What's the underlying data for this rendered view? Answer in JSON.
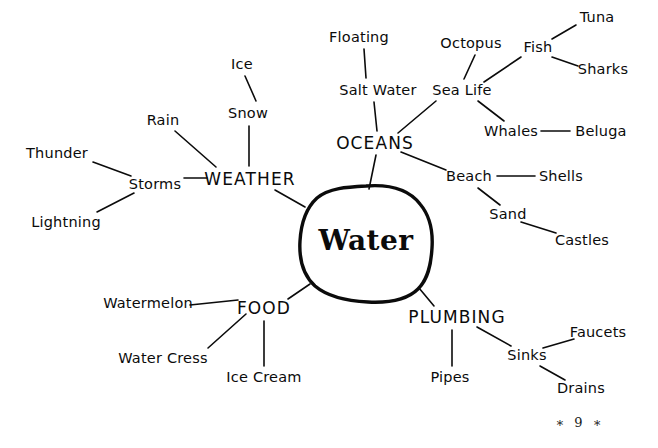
{
  "document": {
    "type": "mind-map",
    "title": "Water",
    "page_number": "9",
    "page_marker": "∗ 9 ∗",
    "background_color": "#ffffff",
    "ink_color": "#0b0b0b"
  },
  "center": {
    "label": "Water",
    "shape": "hand-drawn-blob",
    "x": 366,
    "y": 241
  },
  "branches": [
    {
      "id": "weather",
      "label": "WEATHER",
      "x": 250,
      "y": 179,
      "children": [
        "Rain",
        "Ice",
        "Snow",
        "Storms",
        "Thunder",
        "Lightning"
      ]
    },
    {
      "id": "oceans",
      "label": "OCEANS",
      "x": 375,
      "y": 143,
      "children": [
        "Floating",
        "Salt Water",
        "Sea Life",
        "Octopus",
        "Fish",
        "Tuna",
        "Sharks",
        "Whales",
        "Beluga",
        "Beach",
        "Shells",
        "Sand",
        "Castles"
      ]
    },
    {
      "id": "food",
      "label": "FOOD",
      "x": 264,
      "y": 308,
      "children": [
        "Watermelon",
        "Water Cress",
        "Ice Cream"
      ]
    },
    {
      "id": "plumbing",
      "label": "PLUMBING",
      "x": 457,
      "y": 317,
      "children": [
        "Pipes",
        "Sinks",
        "Faucets",
        "Drains"
      ]
    }
  ],
  "nodes": [
    {
      "id": "thunder",
      "label": "Thunder",
      "x": 57,
      "y": 153,
      "kind": "sub"
    },
    {
      "id": "lightning",
      "label": "Lightning",
      "x": 66,
      "y": 222,
      "kind": "sub"
    },
    {
      "id": "storms",
      "label": "Storms",
      "x": 155,
      "y": 184,
      "kind": "sub"
    },
    {
      "id": "rain",
      "label": "Rain",
      "x": 163,
      "y": 120,
      "kind": "sub"
    },
    {
      "id": "ice",
      "label": "Ice",
      "x": 242,
      "y": 64,
      "kind": "sub"
    },
    {
      "id": "snow",
      "label": "Snow",
      "x": 248,
      "y": 113,
      "kind": "sub"
    },
    {
      "id": "weather",
      "label": "WEATHER",
      "x": 250,
      "y": 179,
      "kind": "branch"
    },
    {
      "id": "floating",
      "label": "Floating",
      "x": 359,
      "y": 37,
      "kind": "sub"
    },
    {
      "id": "saltwater",
      "label": "Salt Water",
      "x": 378,
      "y": 90,
      "kind": "sub"
    },
    {
      "id": "oceans",
      "label": "OCEANS",
      "x": 375,
      "y": 143,
      "kind": "branch"
    },
    {
      "id": "sealife",
      "label": "Sea Life",
      "x": 462,
      "y": 90,
      "kind": "sub"
    },
    {
      "id": "octopus",
      "label": "Octopus",
      "x": 471,
      "y": 43,
      "kind": "sub"
    },
    {
      "id": "fish",
      "label": "Fish",
      "x": 538,
      "y": 47,
      "kind": "sub"
    },
    {
      "id": "tuna",
      "label": "Tuna",
      "x": 597,
      "y": 17,
      "kind": "sub"
    },
    {
      "id": "sharks",
      "label": "Sharks",
      "x": 603,
      "y": 69,
      "kind": "sub"
    },
    {
      "id": "whales",
      "label": "Whales",
      "x": 511,
      "y": 131,
      "kind": "sub"
    },
    {
      "id": "beluga",
      "label": "Beluga",
      "x": 601,
      "y": 131,
      "kind": "sub"
    },
    {
      "id": "beach",
      "label": "Beach",
      "x": 469,
      "y": 176,
      "kind": "sub"
    },
    {
      "id": "shells",
      "label": "Shells",
      "x": 561,
      "y": 176,
      "kind": "sub"
    },
    {
      "id": "sand",
      "label": "Sand",
      "x": 508,
      "y": 214,
      "kind": "sub"
    },
    {
      "id": "castles",
      "label": "Castles",
      "x": 582,
      "y": 240,
      "kind": "sub"
    },
    {
      "id": "watermelon",
      "label": "Watermelon",
      "x": 148,
      "y": 303,
      "kind": "sub"
    },
    {
      "id": "food",
      "label": "FOOD",
      "x": 264,
      "y": 308,
      "kind": "branch"
    },
    {
      "id": "watercress",
      "label": "Water Cress",
      "x": 163,
      "y": 358,
      "kind": "sub"
    },
    {
      "id": "icecream",
      "label": "Ice Cream",
      "x": 264,
      "y": 377,
      "kind": "sub"
    },
    {
      "id": "plumbing",
      "label": "PLUMBING",
      "x": 457,
      "y": 317,
      "kind": "branch"
    },
    {
      "id": "pipes",
      "label": "Pipes",
      "x": 450,
      "y": 377,
      "kind": "sub"
    },
    {
      "id": "sinks",
      "label": "Sinks",
      "x": 527,
      "y": 355,
      "kind": "sub"
    },
    {
      "id": "faucets",
      "label": "Faucets",
      "x": 598,
      "y": 332,
      "kind": "sub"
    },
    {
      "id": "drains",
      "label": "Drains",
      "x": 581,
      "y": 388,
      "kind": "sub"
    }
  ],
  "edges": [
    {
      "from": "thunder",
      "to": "storms",
      "x1": 93,
      "y1": 162,
      "x2": 131,
      "y2": 176
    },
    {
      "from": "lightning",
      "to": "storms",
      "x1": 97,
      "y1": 212,
      "x2": 134,
      "y2": 193
    },
    {
      "from": "storms",
      "to": "weather",
      "x1": 184,
      "y1": 178,
      "x2": 207,
      "y2": 178
    },
    {
      "from": "rain",
      "to": "weather",
      "x1": 175,
      "y1": 131,
      "x2": 216,
      "y2": 167
    },
    {
      "from": "ice",
      "to": "snow",
      "x1": 245,
      "y1": 76,
      "x2": 256,
      "y2": 101
    },
    {
      "from": "snow",
      "to": "weather",
      "x1": 249,
      "y1": 126,
      "x2": 249,
      "y2": 166
    },
    {
      "from": "weather",
      "to": "center",
      "x1": 275,
      "y1": 190,
      "x2": 305,
      "y2": 207
    },
    {
      "from": "floating",
      "to": "saltwater",
      "x1": 364,
      "y1": 49,
      "x2": 366,
      "y2": 78
    },
    {
      "from": "saltwater",
      "to": "oceans",
      "x1": 374,
      "y1": 102,
      "x2": 377,
      "y2": 131
    },
    {
      "from": "oceans",
      "to": "sealife",
      "x1": 398,
      "y1": 133,
      "x2": 436,
      "y2": 101
    },
    {
      "from": "oceans",
      "to": "beach",
      "x1": 401,
      "y1": 152,
      "x2": 446,
      "y2": 170
    },
    {
      "from": "oceans",
      "to": "center",
      "x1": 376,
      "y1": 155,
      "x2": 369,
      "y2": 189
    },
    {
      "from": "sealife",
      "to": "octopus",
      "x1": 464,
      "y1": 79,
      "x2": 475,
      "y2": 55
    },
    {
      "from": "sealife",
      "to": "fish",
      "x1": 484,
      "y1": 82,
      "x2": 521,
      "y2": 57
    },
    {
      "from": "sealife",
      "to": "whales",
      "x1": 478,
      "y1": 101,
      "x2": 504,
      "y2": 121
    },
    {
      "from": "fish",
      "to": "tuna",
      "x1": 552,
      "y1": 39,
      "x2": 576,
      "y2": 25
    },
    {
      "from": "fish",
      "to": "sharks",
      "x1": 552,
      "y1": 57,
      "x2": 578,
      "y2": 66
    },
    {
      "from": "whales",
      "to": "beluga",
      "x1": 541,
      "y1": 131,
      "x2": 570,
      "y2": 131
    },
    {
      "from": "beach",
      "to": "shells",
      "x1": 497,
      "y1": 176,
      "x2": 535,
      "y2": 176
    },
    {
      "from": "beach",
      "to": "sand",
      "x1": 478,
      "y1": 188,
      "x2": 500,
      "y2": 205
    },
    {
      "from": "sand",
      "to": "castles",
      "x1": 521,
      "y1": 222,
      "x2": 556,
      "y2": 233
    },
    {
      "from": "watermelon",
      "to": "food",
      "x1": 190,
      "y1": 305,
      "x2": 238,
      "y2": 300
    },
    {
      "from": "watercress",
      "to": "food",
      "x1": 208,
      "y1": 348,
      "x2": 246,
      "y2": 314
    },
    {
      "from": "icecream",
      "to": "food",
      "x1": 264,
      "y1": 366,
      "x2": 264,
      "y2": 321
    },
    {
      "from": "food",
      "to": "center",
      "x1": 288,
      "y1": 299,
      "x2": 310,
      "y2": 284
    },
    {
      "from": "plumbing",
      "to": "center",
      "x1": 434,
      "y1": 306,
      "x2": 419,
      "y2": 288
    },
    {
      "from": "plumbing",
      "to": "pipes",
      "x1": 452,
      "y1": 330,
      "x2": 452,
      "y2": 366
    },
    {
      "from": "plumbing",
      "to": "sinks",
      "x1": 477,
      "y1": 327,
      "x2": 511,
      "y2": 346
    },
    {
      "from": "sinks",
      "to": "faucets",
      "x1": 543,
      "y1": 348,
      "x2": 574,
      "y2": 339
    },
    {
      "from": "sinks",
      "to": "drains",
      "x1": 540,
      "y1": 366,
      "x2": 565,
      "y2": 380
    }
  ],
  "page_marker_position": {
    "x": 580,
    "y": 422
  }
}
